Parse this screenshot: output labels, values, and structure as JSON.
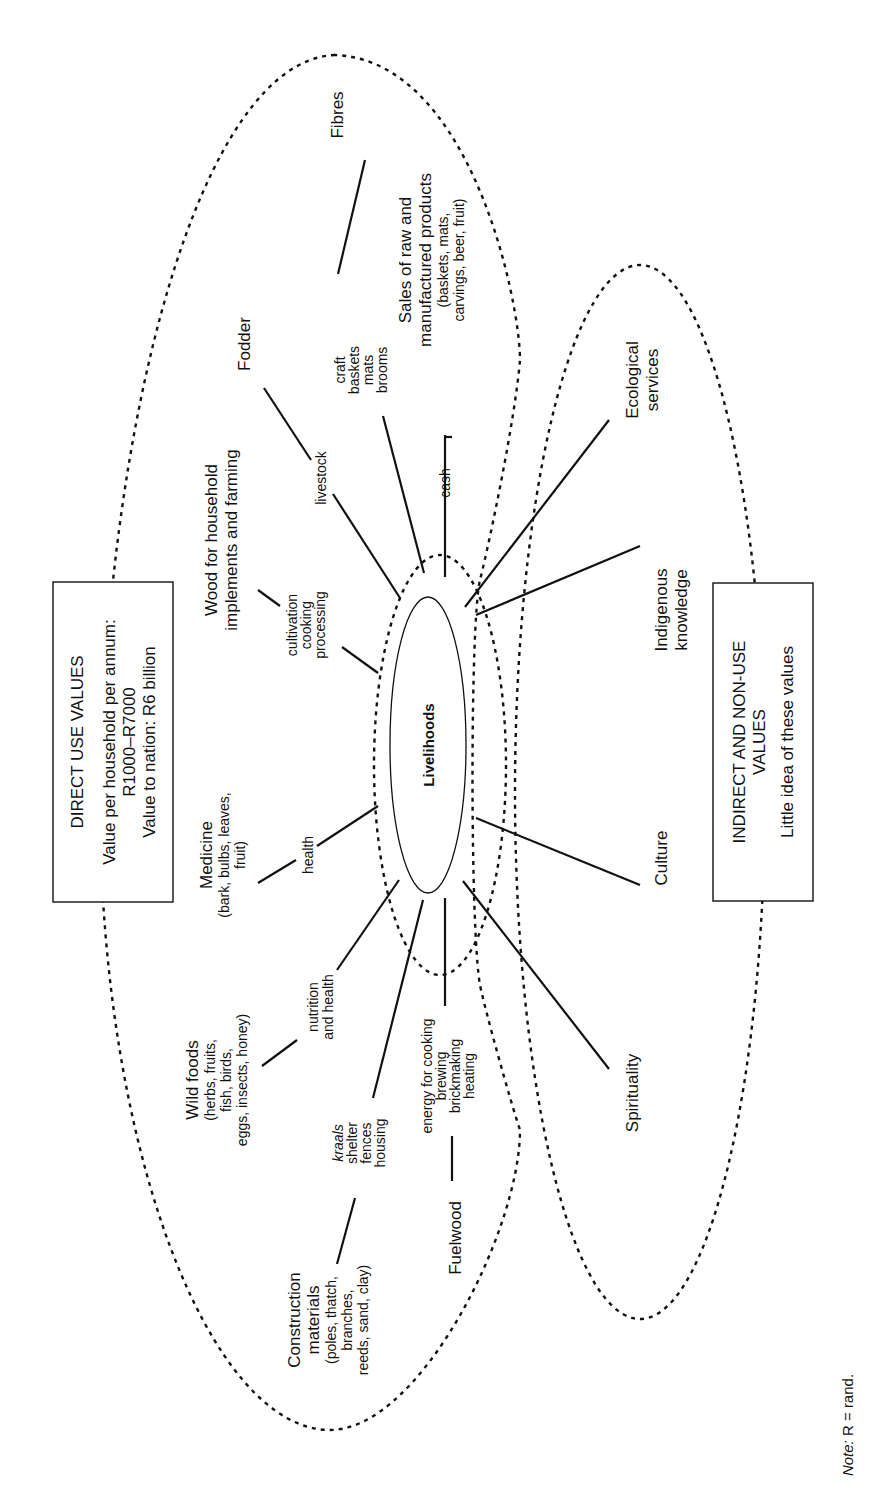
{
  "diagram": {
    "center": {
      "label": "Livelihoods"
    },
    "direct_box": {
      "title": "DIRECT USE VALUES",
      "line1": "Value per household per annum:",
      "line2": "R1000–R7000",
      "line3": "Value to nation: R6 billion"
    },
    "indirect_box": {
      "title_line1": "INDIRECT AND NON-USE",
      "title_line2": "VALUES",
      "subtitle": "Little idea of these values"
    },
    "direct_resources": [
      {
        "id": "fibres",
        "lines": [
          "Fibres"
        ]
      },
      {
        "id": "fodder",
        "lines": [
          "Fodder"
        ]
      },
      {
        "id": "wood",
        "lines": [
          "Wood for household",
          "implements and farming"
        ]
      },
      {
        "id": "medicine",
        "lines": [
          "Medicine",
          "(bark, bulbs, leaves,",
          "fruit)"
        ]
      },
      {
        "id": "wild_foods",
        "lines": [
          "Wild foods",
          "(herbs, fruits,",
          "fish, birds,",
          "eggs, insects, honey)"
        ]
      },
      {
        "id": "construction",
        "lines": [
          "Construction",
          "materials",
          "(poles, thatch,",
          "branches,",
          "reeds, sand, clay)"
        ]
      },
      {
        "id": "fuelwood",
        "lines": [
          "Fuelwood"
        ]
      },
      {
        "id": "sales",
        "lines": [
          "Sales of raw and",
          "manufactured products",
          "(baskets, mats,",
          "carvings, beer, fruit)"
        ]
      }
    ],
    "uses": [
      {
        "id": "craft",
        "lines": [
          "craft",
          "baskets",
          "mats",
          "brooms"
        ]
      },
      {
        "id": "livestock",
        "lines": [
          "livestock"
        ]
      },
      {
        "id": "cultivation",
        "lines": [
          "cultivation",
          "cooking",
          "processing"
        ]
      },
      {
        "id": "health",
        "lines": [
          "health"
        ]
      },
      {
        "id": "nutrition",
        "lines": [
          "nutrition",
          "and health"
        ]
      },
      {
        "id": "shelter",
        "lines": [
          "kraals",
          "shelter",
          "fences",
          "housing"
        ],
        "italic_first": true
      },
      {
        "id": "energy",
        "lines": [
          "energy for cooking",
          "brewing",
          "brickmaking",
          "heating"
        ]
      },
      {
        "id": "cash",
        "lines": [
          "cash"
        ]
      }
    ],
    "indirect_values": [
      {
        "id": "ecological",
        "lines": [
          "Ecological",
          "services"
        ]
      },
      {
        "id": "indigenous",
        "lines": [
          "Indigenous",
          "knowledge"
        ]
      },
      {
        "id": "culture",
        "lines": [
          "Culture"
        ]
      },
      {
        "id": "spirituality",
        "lines": [
          "Spirituality"
        ]
      }
    ],
    "note": {
      "prefix": "Note:",
      "text": " R = rand."
    }
  }
}
